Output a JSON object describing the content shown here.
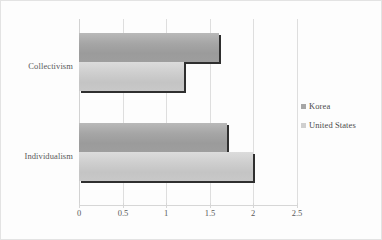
{
  "chart_data": {
    "type": "bar",
    "orientation": "horizontal",
    "title": "",
    "xlabel": "",
    "ylabel": "",
    "categories": [
      "Collectivism",
      "Individualism"
    ],
    "series": [
      {
        "name": "Korea",
        "values": [
          1.6,
          1.7
        ],
        "color": "#a6a6a6"
      },
      {
        "name": "United States",
        "values": [
          1.2,
          2.0
        ],
        "color": "#cfcfcf"
      }
    ],
    "xlim": [
      0,
      2.5
    ],
    "xticks": [
      0,
      0.5,
      1,
      1.5,
      2,
      2.5
    ],
    "xtick_labels": [
      "0",
      "0.5",
      "1",
      "1.5",
      "2",
      "2.5"
    ],
    "grid": "vertical",
    "legend_position": "right"
  },
  "axis": {
    "ticks": [
      {
        "label": "0",
        "value": 0
      },
      {
        "label": "0.5",
        "value": 0.5
      },
      {
        "label": "1",
        "value": 1
      },
      {
        "label": "1.5",
        "value": 1.5
      },
      {
        "label": "2",
        "value": 2
      },
      {
        "label": "2.5",
        "value": 2.5
      }
    ]
  },
  "categories": {
    "collectivism": "Collectivism",
    "individualism": "Individualism"
  },
  "legend": {
    "items": [
      {
        "label": "Korea",
        "swatch": "korea-swatch"
      },
      {
        "label": "United States",
        "swatch": "united-states-swatch"
      }
    ]
  },
  "bars": {
    "collectivism_korea": {
      "value": 1.6,
      "series": "Korea"
    },
    "collectivism_us": {
      "value": 1.2,
      "series": "United States"
    },
    "individualism_korea": {
      "value": 1.7,
      "series": "Korea"
    },
    "individualism_us": {
      "value": 2.0,
      "series": "United States"
    }
  }
}
